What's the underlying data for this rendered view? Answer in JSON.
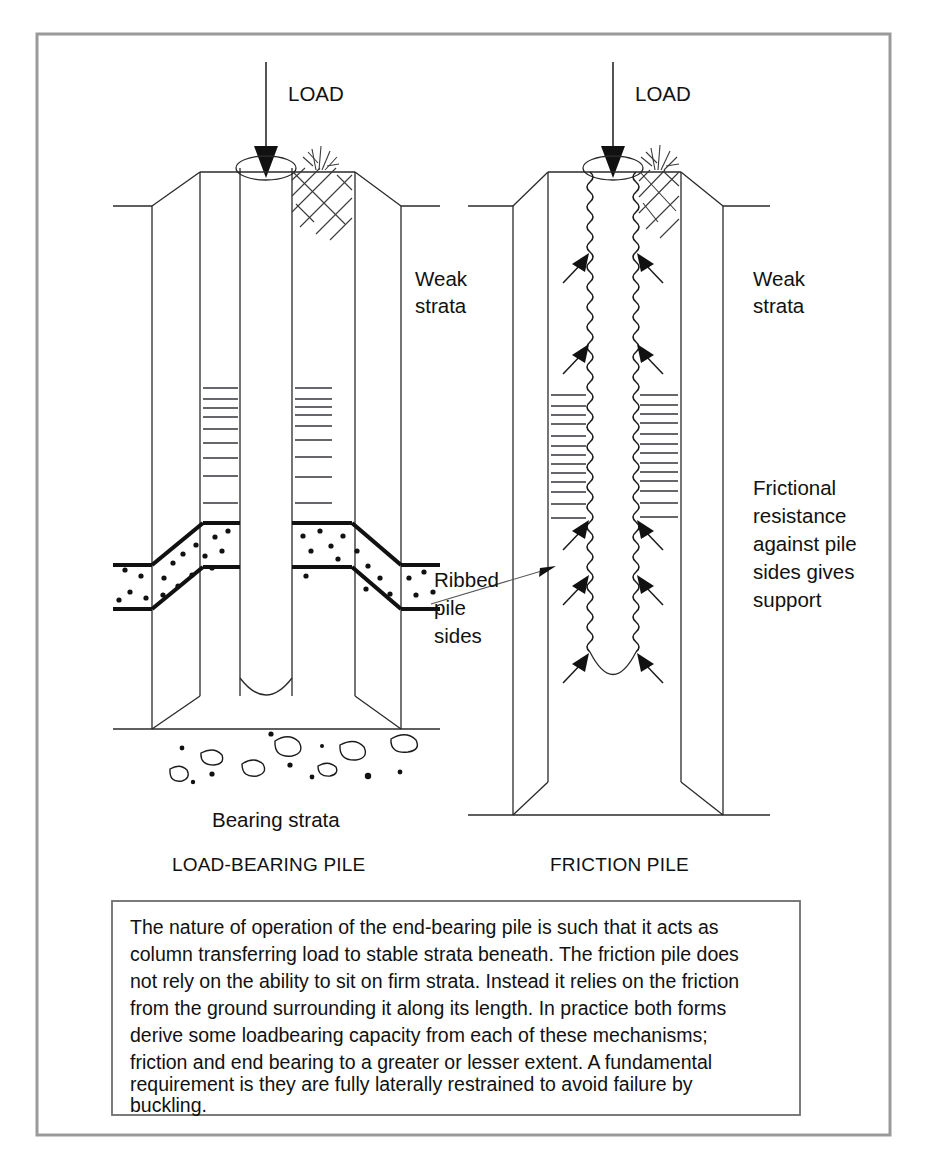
{
  "figure": {
    "frame_color": "#9a9a9a",
    "ink_color": "#111111"
  },
  "left_diagram": {
    "name": "load-bearing-pile",
    "caption": "LOAD-BEARING PILE",
    "load_label": "LOAD",
    "weak_strata_label_line1": "Weak",
    "weak_strata_label_line2": "strata",
    "bearing_strata_label": "Bearing strata"
  },
  "right_diagram": {
    "name": "friction-pile",
    "caption": "FRICTION PILE",
    "load_label": "LOAD",
    "weak_strata_label_line1": "Weak",
    "weak_strata_label_line2": "strata",
    "ribbed_label_line1": "Ribbed",
    "ribbed_label_line2": "pile",
    "ribbed_label_line3": "sides",
    "friction_label_line1": "Frictional",
    "friction_label_line2": "resistance",
    "friction_label_line3": "against pile",
    "friction_label_line4": "sides gives",
    "friction_label_line5": "support"
  },
  "caption_box": {
    "lines": [
      "The nature of operation of the end-bearing pile is such that it acts as",
      "column transferring load to stable strata beneath. The friction pile does",
      "not rely on the ability to sit on firm strata. Instead it relies on the friction",
      "from the ground surrounding it along its length. In practice both forms",
      "derive some loadbearing capacity from each of these mechanisms;",
      "friction and end bearing to a greater or lesser extent. A fundamental",
      "requirement is they are fully laterally restrained to avoid failure by",
      "buckling."
    ]
  }
}
